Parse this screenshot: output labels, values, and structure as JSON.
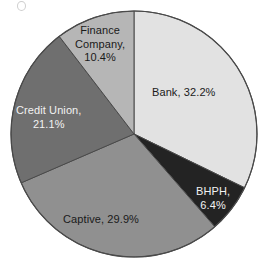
{
  "figure": {
    "background": "#ffffff",
    "outline_color": "#4a4a4a"
  },
  "chart_data": {
    "type": "pie",
    "title": "",
    "subtitle": "",
    "xlabel": "",
    "ylabel": "",
    "grid": false,
    "legend_position": "none",
    "labels_inside_slices": true,
    "start_angle_deg": 0,
    "direction": "clockwise",
    "units": "percent",
    "categories": [
      "Bank",
      "BHPH",
      "Captive",
      "Credit Union",
      "Finance Company"
    ],
    "values": [
      32.2,
      6.4,
      29.9,
      21.1,
      10.4
    ],
    "slices": [
      {
        "name": "Bank",
        "value": 32.2,
        "label": "Bank, 32.2%",
        "color": "#e2e2e2",
        "text_color": "#1a1a1a"
      },
      {
        "name": "BHPH",
        "value": 6.4,
        "label": "BHPH,\n6.4%",
        "color": "#232323",
        "text_color": "#f2f2f2"
      },
      {
        "name": "Captive",
        "value": 29.9,
        "label": "Captive, 29.9%",
        "color": "#909090",
        "text_color": "#1a1a1a"
      },
      {
        "name": "Credit Union",
        "value": 21.1,
        "label": "Credit Union,\n21.1%",
        "color": "#6f6f6f",
        "text_color": "#f2f2f2"
      },
      {
        "name": "Finance Company",
        "value": 10.4,
        "label": "Finance\nCompany,\n10.4%",
        "color": "#b6b6b6",
        "text_color": "#1a1a1a"
      }
    ]
  }
}
